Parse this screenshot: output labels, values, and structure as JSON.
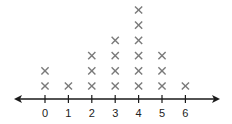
{
  "chart_data": {
    "type": "scatter",
    "subtype": "line-plot (X marks)",
    "title": "",
    "xlabel": "",
    "ylabel": "",
    "categories": [
      "0",
      "1",
      "2",
      "3",
      "4",
      "5",
      "6"
    ],
    "x": [
      0,
      1,
      2,
      3,
      4,
      5,
      6
    ],
    "values": [
      2,
      1,
      3,
      4,
      6,
      3,
      1
    ],
    "xlim": [
      -0.5,
      6.5
    ],
    "marker": "x",
    "marker_color": "#7a7a7a",
    "axis_arrows": "both",
    "grid": false,
    "legend": "none"
  }
}
